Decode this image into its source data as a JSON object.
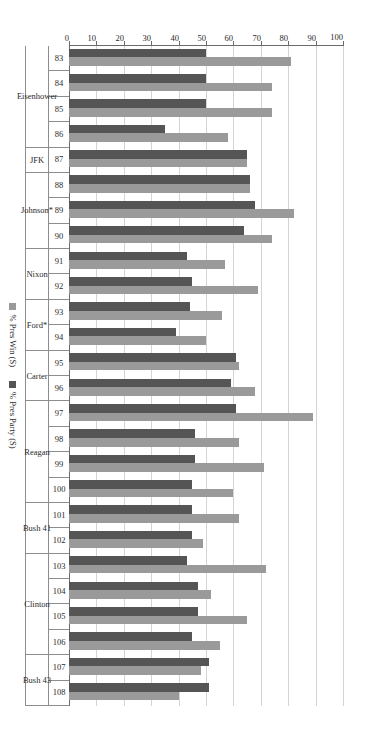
{
  "chart_data": {
    "type": "bar",
    "orientation": "horizontal-rotated",
    "title": "",
    "xlabel": "",
    "ylabel": "",
    "ylim": [
      0,
      100
    ],
    "yticks": [
      0,
      10,
      20,
      30,
      40,
      50,
      60,
      70,
      80,
      90,
      100
    ],
    "grid": true,
    "legend_position": "bottom",
    "categories": [
      "83",
      "84",
      "85",
      "86",
      "87",
      "88",
      "89",
      "90",
      "91",
      "92",
      "93",
      "94",
      "95",
      "96",
      "97",
      "98",
      "99",
      "100",
      "101",
      "102",
      "103",
      "104",
      "105",
      "106",
      "107",
      "108"
    ],
    "series": [
      {
        "name": "% Pres Win (S)",
        "color": "#9a9a9a",
        "values": [
          81,
          74,
          74,
          58,
          65,
          66,
          82,
          74,
          57,
          69,
          56,
          50,
          62,
          68,
          89,
          62,
          71,
          60,
          62,
          49,
          72,
          52,
          65,
          55,
          48,
          40
        ]
      },
      {
        "name": "% Pres Party (S)",
        "color": "#555555",
        "values": [
          50,
          50,
          50,
          35,
          65,
          66,
          68,
          64,
          43,
          45,
          44,
          39,
          61,
          59,
          61,
          46,
          46,
          45,
          45,
          45,
          43,
          47,
          47,
          45,
          51,
          51
        ]
      }
    ],
    "group_bands": [
      {
        "label": "Eisenhower",
        "categories": [
          "83",
          "84",
          "85",
          "86"
        ]
      },
      {
        "label": "JFK",
        "categories": [
          "87"
        ]
      },
      {
        "label": "Johnson*",
        "categories": [
          "88",
          "89",
          "90"
        ]
      },
      {
        "label": "Nixon",
        "categories": [
          "91",
          "92"
        ]
      },
      {
        "label": "Ford*",
        "categories": [
          "93",
          "94"
        ]
      },
      {
        "label": "Carter",
        "categories": [
          "95",
          "96"
        ]
      },
      {
        "label": "Reagan",
        "categories": [
          "97",
          "98",
          "99",
          "100"
        ]
      },
      {
        "label": "Bush 41",
        "categories": [
          "101",
          "102"
        ]
      },
      {
        "label": "Clinton",
        "categories": [
          "103",
          "104",
          "105",
          "106"
        ]
      },
      {
        "label": "Bush 43",
        "categories": [
          "107",
          "108"
        ]
      }
    ]
  },
  "legend": {
    "items": [
      {
        "label": "% Pres Win (S)",
        "swatch": "win"
      },
      {
        "label": "% Pres Party (S)",
        "swatch": "party"
      }
    ]
  },
  "colors": {
    "pres_win": "#9a9a9a",
    "pres_party": "#555555",
    "gridline": "#d4d4d4",
    "axis": "#6b6b6b",
    "text": "#2a2a2a",
    "background": "#ffffff"
  }
}
